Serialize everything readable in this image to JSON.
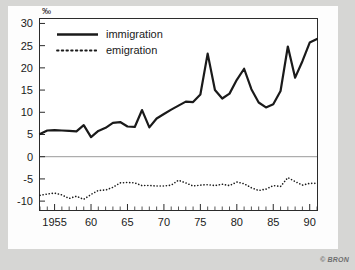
{
  "figure": {
    "copyright": "© BRON",
    "background_color": "#d6d6d4",
    "card_color": "#fdfdfd",
    "line_color": "#1a1a1a"
  },
  "chart_data": {
    "type": "line",
    "title": "",
    "subtitle": "",
    "xlabel": "",
    "ylabel": "",
    "y_unit": "‰",
    "xlim": [
      1953,
      1991
    ],
    "ylim": [
      -12,
      31
    ],
    "grid": false,
    "zero_line": true,
    "legend_position": "top-left",
    "x_tick_labels": [
      "1955",
      "60",
      "65",
      "70",
      "75",
      "80",
      "85",
      "90"
    ],
    "x_tick_values": [
      1955,
      1960,
      1965,
      1970,
      1975,
      1980,
      1985,
      1990
    ],
    "x_minor_ticks": [
      1953,
      1954,
      1956,
      1957,
      1958,
      1959,
      1961,
      1962,
      1963,
      1964,
      1966,
      1967,
      1968,
      1969,
      1971,
      1972,
      1973,
      1974,
      1976,
      1977,
      1978,
      1979,
      1981,
      1982,
      1983,
      1984,
      1986,
      1987,
      1988,
      1989,
      1991
    ],
    "y_tick_labels": [
      "30",
      "25",
      "20",
      "15",
      "10",
      "5",
      "0",
      "-5",
      "-10"
    ],
    "y_tick_values": [
      30,
      25,
      20,
      15,
      10,
      5,
      0,
      -5,
      -10
    ],
    "x": [
      1953,
      1954,
      1955,
      1956,
      1957,
      1958,
      1959,
      1960,
      1961,
      1962,
      1963,
      1964,
      1965,
      1966,
      1967,
      1968,
      1969,
      1970,
      1971,
      1972,
      1973,
      1974,
      1975,
      1976,
      1977,
      1978,
      1979,
      1980,
      1981,
      1982,
      1983,
      1984,
      1985,
      1986,
      1987,
      1988,
      1989,
      1990,
      1991
    ],
    "series": [
      {
        "name": "immigration",
        "style": "solid",
        "width": 2.2,
        "color": "#1a1a1a",
        "values": [
          5.1,
          5.9,
          6.0,
          5.9,
          5.8,
          5.7,
          7.1,
          4.4,
          5.8,
          6.5,
          7.6,
          7.8,
          6.8,
          6.7,
          10.5,
          6.6,
          8.6,
          9.6,
          10.6,
          11.5,
          12.4,
          12.3,
          14.0,
          23.2,
          15.0,
          13.1,
          14.2,
          17.3,
          19.8,
          15.2,
          12.2,
          11.1,
          11.8,
          14.8,
          24.8,
          17.8,
          21.5,
          25.7,
          26.5
        ]
      },
      {
        "name": "emigration",
        "style": "dotted",
        "width": 1.6,
        "color": "#1a1a1a",
        "values": [
          -8.7,
          -8.4,
          -8.2,
          -8.6,
          -9.4,
          -8.9,
          -9.6,
          -8.5,
          -7.6,
          -7.5,
          -6.9,
          -5.9,
          -5.8,
          -5.9,
          -6.5,
          -6.5,
          -6.6,
          -6.6,
          -6.4,
          -5.3,
          -5.9,
          -6.6,
          -6.4,
          -6.3,
          -6.5,
          -6.2,
          -6.5,
          -5.7,
          -6.1,
          -7.0,
          -7.6,
          -7.3,
          -6.5,
          -6.7,
          -4.7,
          -5.6,
          -6.4,
          -6.0,
          -6.0
        ]
      }
    ],
    "legend": [
      {
        "label": "immigration",
        "style": "solid"
      },
      {
        "label": "emigration",
        "style": "dotted"
      }
    ]
  }
}
